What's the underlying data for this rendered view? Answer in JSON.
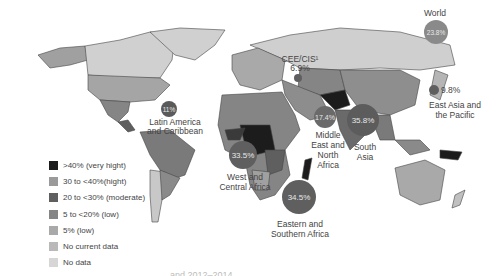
{
  "map": {
    "type": "choropleth-with-bubbles",
    "legend": [
      {
        "label": ">40% (very hight)",
        "color": "#1c1c1c"
      },
      {
        "label": "30 to <40%(hight)",
        "color": "#9a9a9a"
      },
      {
        "label": "20 to <30% (moderate)",
        "color": "#5f5f5f"
      },
      {
        "label": "5 to <20% (low)",
        "color": "#858585"
      },
      {
        "label": "5% (low)",
        "color": "#a9a9a9"
      },
      {
        "label": "No current data",
        "color": "#b9b9b9"
      },
      {
        "label": "No data",
        "color": "#d6d6d6"
      }
    ],
    "regions": [
      {
        "name": "World",
        "value": "23.8%"
      },
      {
        "name": "CEE/CIS¹",
        "value": "6.9%"
      },
      {
        "name": "East Asia and the Pacific",
        "value": "9.8%"
      },
      {
        "name": "Latin America and Caribbean",
        "value": "11%"
      },
      {
        "name": "Middle East and North Africa",
        "value": "17.4%"
      },
      {
        "name": "South Asia",
        "value": "35.8%"
      },
      {
        "name": "West and Central Africa",
        "value": "33.5%"
      },
      {
        "name": "Eastern and Southern Africa",
        "value": "34.5%"
      }
    ],
    "caption": "and 2012–2014"
  },
  "labels": {
    "world": "World",
    "world_value": "23.8%",
    "cee_line1": "CEE/CIS¹",
    "cee_line2": "6.9%",
    "eap_value": "9.8%",
    "eap_line1": "East Asia and",
    "eap_line2": "the Pacific",
    "lac_value": "11%",
    "lac_line1": "Latin America",
    "lac_line2": "and Caribbean",
    "mena_value": "17.4%",
    "mena_line1": "Middle",
    "mena_line2": "East and",
    "mena_line3": "North",
    "mena_line4": "Africa",
    "sa_value": "35.8%",
    "sa_line1": "South",
    "sa_line2": "Asia",
    "wca_value": "33.5%",
    "wca_line1": "West and",
    "wca_line2": "Central Africa",
    "esa_value": "34.5%",
    "esa_line1": "Eastern and",
    "esa_line2": "Southern Africa"
  }
}
